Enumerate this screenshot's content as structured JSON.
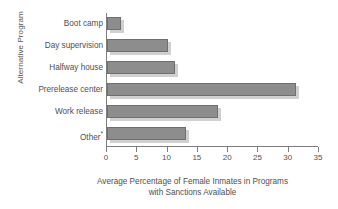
{
  "chart_data": {
    "type": "bar",
    "orientation": "horizontal",
    "title": "",
    "xlabel": "Average Percentage of Female Inmates in Programs with Sanctions Available",
    "xlabel_line1": "Average Percentage of Female Inmates in Programs",
    "xlabel_line2": "with Sanctions Available",
    "ylabel": "Alternative Program",
    "categories": [
      "Boot camp",
      "Day supervision",
      "Halfway house",
      "Prerelease center",
      "Work release",
      "Other*"
    ],
    "values": [
      2.3,
      10.0,
      11.2,
      31.2,
      18.3,
      13.0
    ],
    "xlim": [
      0,
      35
    ],
    "xticks": [
      0,
      5,
      10,
      15,
      20,
      25,
      30,
      35
    ],
    "xtick_labels": [
      "0",
      "5",
      "10",
      "15",
      "20",
      "25",
      "30",
      "35"
    ],
    "grid": false,
    "legend": null,
    "bar_color": "#8d8d8d",
    "bar_edge_color": "#6f6f6f",
    "axis_color": "#7d7d7d",
    "background_color": "#ffffff",
    "text_color": "#4f4f4f",
    "footnote_marker": "*"
  }
}
